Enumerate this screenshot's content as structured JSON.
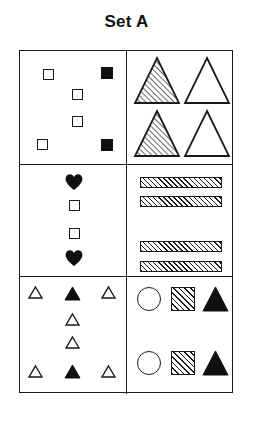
{
  "title": "Set A",
  "figure": {
    "type": "shape-matrix",
    "rows": 3,
    "columns": 2,
    "background": "#ffffff",
    "stroke_color": "#1a1a1a",
    "fill_color": "#101010",
    "cells": [
      {
        "row": 1,
        "column": 1,
        "description": "six small squares in a zigzag arrangement",
        "shape_kind": "square",
        "count": 6,
        "shapes": [
          {
            "name": "square-outline",
            "fill": "white",
            "x": 23,
            "y": 18,
            "size": 11
          },
          {
            "name": "square-filled",
            "fill": "black",
            "x": 81,
            "y": 16,
            "size": 12
          },
          {
            "name": "square-outline",
            "fill": "white",
            "x": 52,
            "y": 38,
            "size": 11
          },
          {
            "name": "square-outline",
            "fill": "white",
            "x": 52,
            "y": 65,
            "size": 11
          },
          {
            "name": "square-outline",
            "fill": "white",
            "x": 17,
            "y": 88,
            "size": 11
          },
          {
            "name": "square-filled",
            "fill": "black",
            "x": 81,
            "y": 88,
            "size": 12
          }
        ]
      },
      {
        "row": 1,
        "column": 2,
        "description": "four large triangles in a 2 by 2 grid, left column hatched, right column white",
        "shape_kind": "triangle",
        "count": 4,
        "shapes": [
          {
            "name": "triangle-hatched",
            "fill": "hatched",
            "x": 8,
            "y": 7,
            "w": 44,
            "h": 45
          },
          {
            "name": "triangle-outline",
            "fill": "white",
            "x": 58,
            "y": 7,
            "w": 44,
            "h": 45
          },
          {
            "name": "triangle-hatched",
            "fill": "hatched",
            "x": 8,
            "y": 60,
            "w": 44,
            "h": 45
          },
          {
            "name": "triangle-outline",
            "fill": "white",
            "x": 58,
            "y": 60,
            "w": 44,
            "h": 45
          }
        ]
      },
      {
        "row": 2,
        "column": 1,
        "description": "vertical column of four shapes: heart, square, square, heart",
        "shape_kind": "mixed",
        "count": 4,
        "shapes": [
          {
            "name": "heart-filled",
            "fill": "black",
            "x": 45,
            "y": 8,
            "size": 18
          },
          {
            "name": "square-outline",
            "fill": "white",
            "x": 49,
            "y": 35,
            "size": 11
          },
          {
            "name": "square-outline",
            "fill": "white",
            "x": 49,
            "y": 63,
            "size": 11
          },
          {
            "name": "heart-filled",
            "fill": "black",
            "x": 45,
            "y": 84,
            "size": 18
          }
        ]
      },
      {
        "row": 2,
        "column": 2,
        "description": "four horizontal hatched bars, grouped two at top and two at bottom",
        "shape_kind": "bar",
        "count": 4,
        "shapes": [
          {
            "name": "bar-hatched",
            "fill": "hatched",
            "x": 13,
            "y": 12,
            "w": 82,
            "h": 11
          },
          {
            "name": "bar-hatched",
            "fill": "hatched",
            "x": 13,
            "y": 31,
            "w": 82,
            "h": 11
          },
          {
            "name": "bar-hatched",
            "fill": "hatched",
            "x": 13,
            "y": 76,
            "w": 82,
            "h": 11
          },
          {
            "name": "bar-hatched",
            "fill": "hatched",
            "x": 13,
            "y": 96,
            "w": 82,
            "h": 11
          }
        ]
      },
      {
        "row": 3,
        "column": 1,
        "description": "small triangles: a top row of three, two stacked in the middle column, and a bottom row of three",
        "shape_kind": "triangle",
        "count": 8,
        "shapes": [
          {
            "name": "triangle-outline",
            "fill": "white",
            "x": 9,
            "y": 10,
            "w": 13,
            "h": 11
          },
          {
            "name": "triangle-filled",
            "fill": "black",
            "x": 45,
            "y": 10,
            "w": 15,
            "h": 13
          },
          {
            "name": "triangle-outline",
            "fill": "white",
            "x": 82,
            "y": 10,
            "w": 13,
            "h": 11
          },
          {
            "name": "triangle-outline",
            "fill": "white",
            "x": 46,
            "y": 37,
            "w": 13,
            "h": 11
          },
          {
            "name": "triangle-outline",
            "fill": "white",
            "x": 46,
            "y": 60,
            "w": 13,
            "h": 11
          },
          {
            "name": "triangle-outline",
            "fill": "white",
            "x": 9,
            "y": 89,
            "w": 13,
            "h": 11
          },
          {
            "name": "triangle-filled",
            "fill": "black",
            "x": 45,
            "y": 88,
            "w": 15,
            "h": 13
          },
          {
            "name": "triangle-outline",
            "fill": "white",
            "x": 82,
            "y": 89,
            "w": 13,
            "h": 11
          }
        ]
      },
      {
        "row": 3,
        "column": 2,
        "description": "two identical rows each containing a white circle, a hatched square and a black triangle",
        "shape_kind": "mixed",
        "count": 6,
        "shapes": [
          {
            "name": "circle-outline",
            "fill": "white",
            "x": 10,
            "y": 10,
            "size": 24
          },
          {
            "name": "square-hatched",
            "fill": "hatched",
            "x": 44,
            "y": 10,
            "size": 24
          },
          {
            "name": "triangle-filled",
            "fill": "black",
            "x": 76,
            "y": 10,
            "w": 25,
            "h": 24
          },
          {
            "name": "circle-outline",
            "fill": "white",
            "x": 10,
            "y": 74,
            "size": 24
          },
          {
            "name": "square-hatched",
            "fill": "hatched",
            "x": 44,
            "y": 74,
            "size": 24
          },
          {
            "name": "triangle-filled",
            "fill": "black",
            "x": 76,
            "y": 74,
            "w": 25,
            "h": 24
          }
        ]
      }
    ]
  }
}
